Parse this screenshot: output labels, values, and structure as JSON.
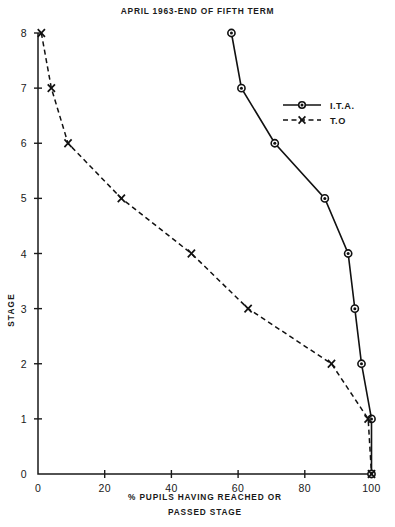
{
  "chart": {
    "title": "APRIL 1963-END OF FIFTH TERM",
    "y_axis_name": "STAGE",
    "x_caption_line1": "% PUPILS HAVING REACHED OR",
    "x_caption_line2": "PASSED STAGE",
    "legend": {
      "ita_label": "I.T.A.",
      "to_label": "T.O"
    },
    "xticks": [
      "0",
      "20",
      "40",
      "60",
      "80",
      "100"
    ],
    "yticks": [
      "0",
      "1",
      "2",
      "3",
      "4",
      "5",
      "6",
      "7",
      "8"
    ]
  },
  "chart_data": {
    "type": "line",
    "title": "APRIL 1963-END OF FIFTH TERM",
    "xlabel": "% PUPILS HAVING REACHED OR PASSED STAGE",
    "ylabel": "STAGE",
    "xlim": [
      0,
      100
    ],
    "ylim": [
      0,
      8
    ],
    "xticks": [
      0,
      20,
      40,
      60,
      80,
      100
    ],
    "yticks": [
      0,
      1,
      2,
      3,
      4,
      5,
      6,
      7,
      8
    ],
    "grid": false,
    "legend_position": "upper-right-inside",
    "orientation": "x = percent of pupils, y = stage",
    "series": [
      {
        "name": "I.T.A.",
        "marker": "circle",
        "linestyle": "solid",
        "color": "#111111",
        "points": [
          {
            "stage": 8,
            "percent": 58
          },
          {
            "stage": 7,
            "percent": 61
          },
          {
            "stage": 6,
            "percent": 71
          },
          {
            "stage": 5,
            "percent": 86
          },
          {
            "stage": 4,
            "percent": 93
          },
          {
            "stage": 3,
            "percent": 95
          },
          {
            "stage": 2,
            "percent": 97
          },
          {
            "stage": 1,
            "percent": 100
          },
          {
            "stage": 0,
            "percent": 100
          }
        ]
      },
      {
        "name": "T.O",
        "marker": "x",
        "linestyle": "dashed",
        "color": "#111111",
        "points": [
          {
            "stage": 8,
            "percent": 1
          },
          {
            "stage": 7,
            "percent": 4
          },
          {
            "stage": 6,
            "percent": 9
          },
          {
            "stage": 5,
            "percent": 25
          },
          {
            "stage": 4,
            "percent": 46
          },
          {
            "stage": 3,
            "percent": 63
          },
          {
            "stage": 2,
            "percent": 88
          },
          {
            "stage": 1,
            "percent": 99
          },
          {
            "stage": 0,
            "percent": 100
          }
        ]
      }
    ]
  }
}
